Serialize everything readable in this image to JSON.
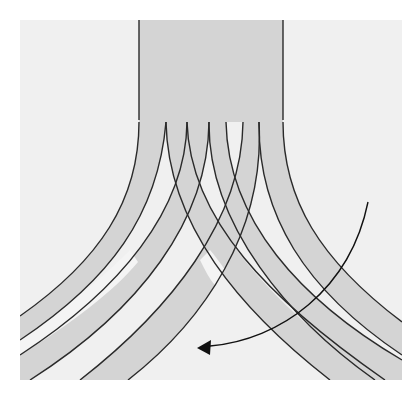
{
  "diagram": {
    "title": "",
    "colors": {
      "page_background": "#ffffff",
      "panel_background": "#f0f0f0",
      "band_fill": "#d4d4d4",
      "strand_fill": "#d4d4d4",
      "outline": "#2a2a2a",
      "arrow": "#111111"
    },
    "panel": {
      "x": 20,
      "y": 20,
      "width": 382,
      "height": 360
    },
    "band": {
      "x": 139,
      "y": 20,
      "width": 144,
      "height": 100
    },
    "strands_left": 3,
    "strands_right": 3,
    "arrow": {
      "direction": "clockwise-curving-left",
      "start": [
        368,
        202
      ],
      "end": [
        198,
        348
      ]
    }
  }
}
